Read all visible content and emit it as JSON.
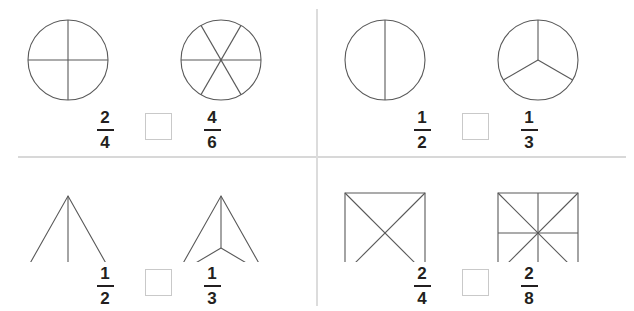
{
  "worksheet": {
    "type": "fraction-comparison-worksheet",
    "shape_outline_color": "#595959",
    "divider_color": "#d8d8d8",
    "text_color": "#231f20",
    "answer_box_border_color": "#c9c9c9",
    "answer_box_value": "",
    "problems": [
      {
        "id": "problem-1",
        "position": "top-left",
        "left_shape": {
          "name": "circle-fourths",
          "kind": "circle",
          "parts": 4
        },
        "right_shape": {
          "name": "circle-sixths",
          "kind": "circle",
          "parts": 6
        },
        "left_fraction": {
          "numerator": "2",
          "denominator": "4"
        },
        "right_fraction": {
          "numerator": "4",
          "denominator": "6"
        },
        "comparison_answer": ""
      },
      {
        "id": "problem-2",
        "position": "top-right",
        "left_shape": {
          "name": "circle-halves",
          "kind": "circle",
          "parts": 2
        },
        "right_shape": {
          "name": "circle-thirds",
          "kind": "circle",
          "parts": 3
        },
        "left_fraction": {
          "numerator": "1",
          "denominator": "2"
        },
        "right_fraction": {
          "numerator": "1",
          "denominator": "3"
        },
        "comparison_answer": ""
      },
      {
        "id": "problem-3",
        "position": "bottom-left",
        "left_shape": {
          "name": "triangle-halves",
          "kind": "triangle",
          "parts": 2
        },
        "right_shape": {
          "name": "triangle-thirds",
          "kind": "triangle",
          "parts": 3
        },
        "left_fraction": {
          "numerator": "1",
          "denominator": "2"
        },
        "right_fraction": {
          "numerator": "1",
          "denominator": "3"
        },
        "comparison_answer": ""
      },
      {
        "id": "problem-4",
        "position": "bottom-right",
        "left_shape": {
          "name": "square-fourths",
          "kind": "square",
          "parts": 4
        },
        "right_shape": {
          "name": "square-eighths",
          "kind": "square",
          "parts": 8
        },
        "left_fraction": {
          "numerator": "2",
          "denominator": "4"
        },
        "right_fraction": {
          "numerator": "2",
          "denominator": "8"
        },
        "comparison_answer": ""
      }
    ]
  }
}
